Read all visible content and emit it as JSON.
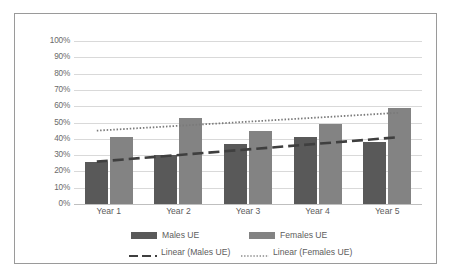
{
  "chart_data": {
    "type": "bar",
    "title": "",
    "xlabel": "",
    "ylabel": "",
    "ylim": [
      0,
      100
    ],
    "grid": true,
    "legend_position": "bottom",
    "categories": [
      "Year 1",
      "Year 2",
      "Year 3",
      "Year 4",
      "Year 5"
    ],
    "ytick_labels": [
      "100%",
      "90%",
      "80%",
      "70%",
      "60%",
      "50%",
      "40%",
      "30%",
      "20%",
      "10%",
      "0%"
    ],
    "ytick_values": [
      100,
      90,
      80,
      70,
      60,
      50,
      40,
      30,
      20,
      10,
      0
    ],
    "series": [
      {
        "name": "Males UE",
        "type": "bar",
        "color": "#595959",
        "values": [
          26,
          30,
          37,
          41,
          38
        ]
      },
      {
        "name": "Females UE",
        "type": "bar",
        "color": "#838383",
        "values": [
          41,
          53,
          45,
          49,
          59
        ]
      },
      {
        "name": "Linear (Males UE)",
        "type": "trendline",
        "style": "dashed",
        "color": "#3f3f3f",
        "endpoints": [
          26,
          41
        ]
      },
      {
        "name": "Linear (Females UE)",
        "type": "trendline",
        "style": "dotted",
        "color": "#7a7a7a",
        "endpoints": [
          45,
          56
        ]
      }
    ]
  },
  "legend": {
    "items": [
      {
        "label": "Males UE",
        "marker": "bar-swatch-dark"
      },
      {
        "label": "Females UE",
        "marker": "bar-swatch-light"
      },
      {
        "label": "Linear (Males UE)",
        "marker": "dashed-line-swatch"
      },
      {
        "label": "Linear (Females UE)",
        "marker": "dotted-line-swatch"
      }
    ]
  }
}
